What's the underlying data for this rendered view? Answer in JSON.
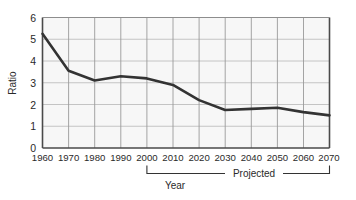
{
  "chart_data": {
    "type": "line",
    "title": "",
    "xlabel": "Year",
    "ylabel": "Ratio",
    "xlim": [
      1960,
      2070
    ],
    "ylim": [
      0,
      6
    ],
    "grid": true,
    "legend": false,
    "x": [
      1960,
      1970,
      1980,
      1990,
      2000,
      2010,
      2020,
      2030,
      2040,
      2050,
      2060,
      2070
    ],
    "values": [
      5.25,
      3.55,
      3.1,
      3.3,
      3.2,
      2.9,
      2.2,
      1.75,
      1.8,
      1.85,
      1.65,
      1.5
    ],
    "series": [
      {
        "name": "Ratio",
        "values": [
          5.25,
          3.55,
          3.1,
          3.3,
          3.2,
          2.9,
          2.2,
          1.75,
          1.8,
          1.85,
          1.65,
          1.5
        ]
      }
    ],
    "xticklabels": [
      "1960",
      "1970",
      "1980",
      "1990",
      "2000",
      "2010",
      "2020",
      "2030",
      "2040",
      "2050",
      "2060",
      "2070"
    ],
    "yticklabels": [
      "0",
      "1",
      "2",
      "3",
      "4",
      "5",
      "6"
    ],
    "yticks": [
      0,
      1,
      2,
      3,
      4,
      5,
      6
    ],
    "annotations": [
      {
        "label": "Projected",
        "type": "bracket",
        "x_start": 2000,
        "x_end": 2070
      }
    ],
    "line_color": "#333333",
    "plot_background": "#f7f7f7",
    "grid_color": "#b8b8b8"
  },
  "yaxis": {
    "title": "Ratio",
    "ticks": [
      "6",
      "5",
      "4",
      "3",
      "2",
      "1",
      "0"
    ]
  },
  "xaxis": {
    "title": "Year",
    "ticks": [
      "1960",
      "1970",
      "1980",
      "1990",
      "2000",
      "2010",
      "2020",
      "2030",
      "2040",
      "2050",
      "2060",
      "2070"
    ]
  },
  "annotation": {
    "projected_label": "Projected"
  }
}
